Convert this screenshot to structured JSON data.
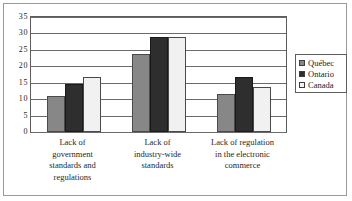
{
  "chart_data": {
    "type": "bar",
    "title": "",
    "subtitle": "",
    "xlabel": "",
    "ylabel": "",
    "ylim": [
      0,
      35
    ],
    "ytick_step": 5,
    "yticks": [
      "35",
      "30",
      "25",
      "20",
      "15",
      "10",
      "5",
      "0"
    ],
    "grid": true,
    "legend_position": "right",
    "categories": [
      "Lack of government standards and regulations",
      "Lack of industry-wide standards",
      "Lack of regulation in the electronic commerce"
    ],
    "category_lines": [
      [
        "Lack of",
        "government",
        "standards and",
        "regulations"
      ],
      [
        "Lack of",
        "industry-wide",
        "standards"
      ],
      [
        "Lack of regulation",
        "in the electronic",
        "commerce"
      ]
    ],
    "series": [
      {
        "name": "Québec",
        "color": "#878787",
        "values": [
          11.0,
          23.7,
          11.5
        ]
      },
      {
        "name": "Ontario",
        "color": "#2e2e2e",
        "values": [
          14.5,
          29.0,
          16.7
        ]
      },
      {
        "name": "Canada",
        "color": "#f1f1f1",
        "values": [
          16.6,
          28.8,
          13.6
        ]
      }
    ]
  },
  "legend": {
    "entries": [
      {
        "label": "Québec"
      },
      {
        "label": "Ontario"
      },
      {
        "label": "Canada"
      }
    ]
  }
}
